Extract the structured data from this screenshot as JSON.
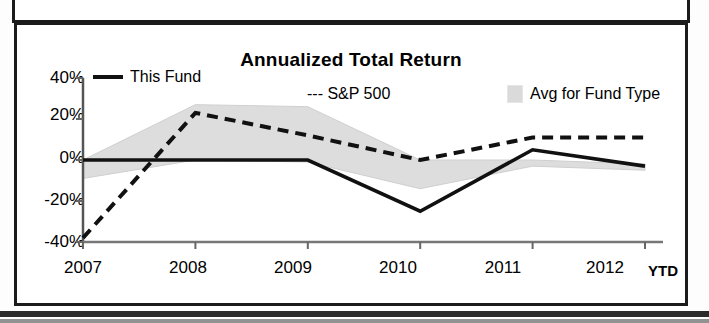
{
  "chart_data": {
    "type": "line",
    "title": "Annualized Total Return",
    "xlabel": "",
    "ylabel": "",
    "x": [
      "2007",
      "2008",
      "2009",
      "2010",
      "2011",
      "2012"
    ],
    "x_suffix_label": "YTD",
    "categories": [
      "2007",
      "2008",
      "2009",
      "2010",
      "2011",
      "2012"
    ],
    "ytick_labels": [
      "40%",
      "20%",
      "0%",
      "-20%",
      "-40%"
    ],
    "ytick_values": [
      40,
      20,
      0,
      -20,
      -40
    ],
    "ylim": [
      -40,
      40
    ],
    "grid": false,
    "legend_position": "top",
    "series": [
      {
        "name": "This Fund",
        "style": "solid",
        "color": "#111111",
        "values": [
          0,
          0,
          0,
          -25,
          5,
          -3
        ]
      },
      {
        "name": "S&P 500",
        "style": "dashed",
        "color": "#111111",
        "values": [
          -38,
          23,
          12,
          0,
          11,
          11
        ]
      },
      {
        "name": "Avg for Fund Type",
        "style": "band",
        "color": "#d4d4d4",
        "upper": [
          0,
          27,
          26,
          0,
          0,
          -2
        ],
        "lower": [
          -9,
          0,
          -1,
          -14,
          -3,
          -5
        ]
      }
    ],
    "legend": [
      "This Fund",
      "S&P 500",
      "Avg for Fund Type"
    ]
  },
  "legend": {
    "this_fund": "This Fund",
    "sp500": "--- S&P 500",
    "avg_fund_type": "Avg for Fund Type"
  },
  "axis": {
    "y": [
      "40%",
      "20%",
      "0%",
      "-20%",
      "-40%"
    ],
    "x": [
      "2007",
      "2008",
      "2009",
      "2010",
      "2011",
      "2012"
    ],
    "ytd": "YTD"
  },
  "colors": {
    "line": "#111111",
    "band": "#d4d4d4",
    "frame": "#1b1b1b"
  }
}
